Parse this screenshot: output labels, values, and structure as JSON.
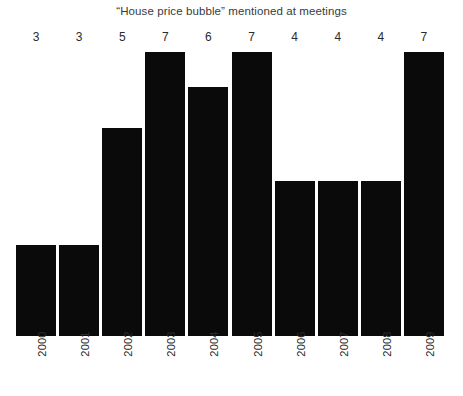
{
  "chart_data": {
    "type": "bar",
    "title": "“House price bubble” mentioned at meetings",
    "xlabel": "",
    "ylabel": "",
    "grid": false,
    "legend": false,
    "categories": [
      "2000",
      "2001",
      "2002",
      "2003",
      "2004",
      "2005",
      "2006",
      "2007",
      "2008",
      "2009"
    ],
    "values": [
      3,
      3,
      5,
      7,
      6,
      7,
      4,
      4,
      4,
      7
    ],
    "bar_pixel_heights": [
      91,
      91,
      208,
      284,
      249,
      284,
      155,
      155,
      155,
      284
    ],
    "plot_pixel_height": 308,
    "bar_color": "#0a0a0a",
    "background_color": "#ffffff",
    "bars": [
      {
        "category": "2000",
        "value": "3",
        "pixel_height": 91
      },
      {
        "category": "2001",
        "value": "3",
        "pixel_height": 91
      },
      {
        "category": "2002",
        "value": "5",
        "pixel_height": 208
      },
      {
        "category": "2003",
        "value": "7",
        "pixel_height": 284
      },
      {
        "category": "2004",
        "value": "6",
        "pixel_height": 249
      },
      {
        "category": "2005",
        "value": "7",
        "pixel_height": 284
      },
      {
        "category": "2006",
        "value": "4",
        "pixel_height": 155
      },
      {
        "category": "2007",
        "value": "4",
        "pixel_height": 155
      },
      {
        "category": "2008",
        "value": "4",
        "pixel_height": 155
      },
      {
        "category": "2009",
        "value": "7",
        "pixel_height": 284
      }
    ]
  }
}
